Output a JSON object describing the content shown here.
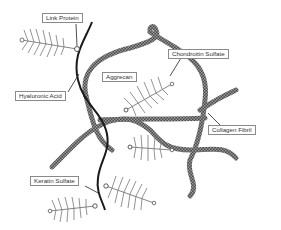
{
  "diagram": {
    "labels": {
      "link_protein": "Link Protein",
      "hyaluronic_acid": "Hyaluronic Acid",
      "aggrecan": "Aggrecan",
      "chondroitin_sulfate": "Chondroitin Sulfate",
      "collagen_fibril": "Collagen Fibril",
      "keratin_sulfate": "Keratin Sulfate"
    },
    "colors": {
      "collagen": "#555555",
      "hyaluronic": "#1a1a1a",
      "proteoglycan": "#777777",
      "label_border": "#8a8a8a",
      "background": "#ffffff"
    }
  }
}
